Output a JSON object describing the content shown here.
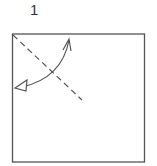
{
  "diagram": {
    "step_number": "1",
    "paper": {
      "shape": "square",
      "x": 12.5,
      "y": 34,
      "width": 132,
      "height": 128,
      "stroke": "#555555"
    },
    "fold_line": {
      "type": "valley-fold-dashed",
      "from": [
        13,
        35
      ],
      "to": [
        82,
        100
      ],
      "stroke": "#555555"
    },
    "arrow": {
      "type": "fold-and-unfold",
      "path_start": [
        69,
        40
      ],
      "path_end": [
        17,
        88
      ],
      "head_start": "open-v",
      "head_end": "hollow-triangle",
      "stroke": "#555555"
    }
  }
}
